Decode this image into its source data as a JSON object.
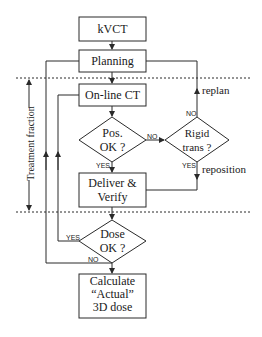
{
  "diagram": {
    "type": "flowchart",
    "colors": {
      "line": "#2a2a2a",
      "background": "#ffffff"
    },
    "nodes": {
      "kvct": {
        "label": "kVCT"
      },
      "planning": {
        "label": "Planning"
      },
      "online_ct": {
        "label": "On-line CT"
      },
      "pos_ok": {
        "line1": "Pos.",
        "line2": "OK ?"
      },
      "rigid_trans": {
        "line1": "Rigid",
        "line2": "trans ?"
      },
      "deliver_verify": {
        "line1": "Deliver &",
        "line2": "Verify"
      },
      "dose_ok": {
        "line1": "Dose",
        "line2": "OK ?"
      },
      "calculate": {
        "line1": "Calculate",
        "line2": "“Actual”",
        "line3": "3D dose"
      }
    },
    "edge_labels": {
      "pos_no": "NO",
      "pos_yes": "YES",
      "rigid_no": "NO",
      "rigid_yes": "YES",
      "replan": "replan",
      "reposition": "reposition",
      "dose_yes": "YES",
      "dose_no": "NO"
    },
    "side_label": "Treatment fraction"
  }
}
